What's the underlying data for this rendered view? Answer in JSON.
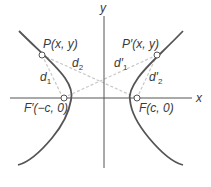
{
  "diagram": {
    "axes": {
      "x_label": "x",
      "y_label": "y"
    },
    "points": {
      "P": {
        "name": "P",
        "coords": "(x, y)",
        "label": "P(x, y)"
      },
      "P_prime": {
        "name": "P′",
        "coords": "(x, y)",
        "label": "P′(x, y)"
      },
      "F_prime": {
        "name": "F′",
        "coords": "(−c, 0)",
        "label": "F′(−c, 0)"
      },
      "F": {
        "name": "F",
        "coords": "(c, 0)",
        "label": "F(c, 0)"
      }
    },
    "distances": {
      "d1": {
        "base": "d",
        "sub": "1"
      },
      "d2": {
        "base": "d",
        "sub": "2"
      },
      "d1_prime": {
        "base": "d′",
        "sub": "1"
      },
      "d2_prime": {
        "base": "d′",
        "sub": "2"
      }
    },
    "colors": {
      "curve": "#555555",
      "axis": "#555555",
      "dashed": "#c8c8c8",
      "text": "#3a3a3a",
      "point_fill": "#ffffff"
    }
  }
}
